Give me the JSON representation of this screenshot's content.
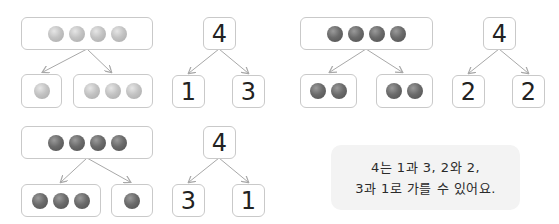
{
  "panels": [
    {
      "id": "light-1-3",
      "ball_color": "light",
      "whole": {
        "count": 4
      },
      "parts": [
        {
          "count": 1
        },
        {
          "count": 3
        }
      ],
      "number_tree": {
        "whole": "4",
        "left": "1",
        "right": "3"
      }
    },
    {
      "id": "dark-2-2",
      "ball_color": "dark",
      "whole": {
        "count": 4
      },
      "parts": [
        {
          "count": 2
        },
        {
          "count": 2
        }
      ],
      "number_tree": {
        "whole": "4",
        "left": "2",
        "right": "2"
      }
    },
    {
      "id": "dark-3-1",
      "ball_color": "dark",
      "whole": {
        "count": 4
      },
      "parts": [
        {
          "count": 3
        },
        {
          "count": 1
        }
      ],
      "number_tree": {
        "whole": "4",
        "left": "3",
        "right": "1"
      }
    }
  ],
  "caption": {
    "line1": "4는 1과 3, 2와 2,",
    "line2": "3과 1로 가를 수 있어요."
  },
  "colors": {
    "border": "#c9c9c9",
    "arrow": "#a8a8a8",
    "caption_bg": "#f3f3f3",
    "ball_light": "#c3c3c3",
    "ball_dark": "#6b6b6b"
  }
}
